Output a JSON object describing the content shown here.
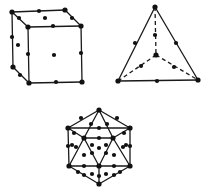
{
  "figure": {
    "colors": {
      "line": "#1a1a1a",
      "atom": "#111111",
      "background": "#ffffff"
    },
    "structures": [
      {
        "name": "face-centered-cube",
        "shape": "cube",
        "vertices": [
          [
            12,
            12
          ],
          [
            65,
            10
          ],
          [
            81,
            26
          ],
          [
            28,
            27
          ],
          [
            13,
            67
          ],
          [
            29,
            83
          ],
          [
            82,
            82
          ]
        ],
        "edges": [
          [
            0,
            1
          ],
          [
            1,
            2
          ],
          [
            2,
            3
          ],
          [
            3,
            0
          ],
          [
            3,
            5
          ],
          [
            5,
            6
          ],
          [
            6,
            2
          ],
          [
            0,
            4
          ],
          [
            4,
            5
          ]
        ],
        "atoms": [
          [
            12,
            12
          ],
          [
            39,
            11
          ],
          [
            65,
            10
          ],
          [
            19,
            18
          ],
          [
            72,
            18
          ],
          [
            28,
            27
          ],
          [
            53,
            26
          ],
          [
            81,
            26
          ],
          [
            45,
            18
          ],
          [
            12,
            37
          ],
          [
            18,
            45
          ],
          [
            28,
            54
          ],
          [
            81,
            53
          ],
          [
            54,
            55
          ],
          [
            13,
            67
          ],
          [
            20,
            75
          ],
          [
            29,
            83
          ],
          [
            56,
            82
          ],
          [
            82,
            82
          ]
        ]
      },
      {
        "name": "tetrahedron",
        "shape": "tetrahedron",
        "vertices": [
          [
            155,
            7
          ],
          [
            118,
            81
          ],
          [
            198,
            80
          ],
          [
            156,
            55
          ]
        ],
        "edges": [
          [
            0,
            1
          ],
          [
            0,
            2
          ],
          [
            1,
            2
          ]
        ],
        "dashed_edges": [
          [
            0,
            3
          ],
          [
            3,
            1
          ],
          [
            3,
            2
          ]
        ],
        "atoms": [
          [
            155,
            7
          ],
          [
            135,
            43
          ],
          [
            176,
            43
          ],
          [
            155,
            35
          ],
          [
            156,
            55
          ],
          [
            141,
            66
          ],
          [
            174,
            67
          ],
          [
            118,
            81
          ],
          [
            157,
            81
          ],
          [
            198,
            80
          ]
        ]
      },
      {
        "name": "icosahedron",
        "shape": "icosahedron",
        "vertices": [
          [
            99,
            110
          ],
          [
            68,
            128
          ],
          [
            130,
            128
          ],
          [
            84,
            138
          ],
          [
            113,
            138
          ],
          [
            69,
            166
          ],
          [
            130,
            166
          ],
          [
            99,
            166
          ],
          [
            99,
            184
          ]
        ],
        "edges": [
          [
            0,
            1
          ],
          [
            0,
            2
          ],
          [
            0,
            3
          ],
          [
            0,
            4
          ],
          [
            1,
            3
          ],
          [
            3,
            4
          ],
          [
            4,
            2
          ],
          [
            1,
            5
          ],
          [
            2,
            6
          ],
          [
            3,
            5
          ],
          [
            3,
            7
          ],
          [
            4,
            7
          ],
          [
            4,
            6
          ],
          [
            5,
            7
          ],
          [
            7,
            6
          ],
          [
            5,
            8
          ],
          [
            7,
            8
          ],
          [
            6,
            8
          ],
          [
            1,
            2
          ]
        ],
        "atoms": [
          [
            99,
            110
          ],
          [
            68,
            128
          ],
          [
            130,
            128
          ],
          [
            84,
            138
          ],
          [
            113,
            138
          ],
          [
            69,
            166
          ],
          [
            130,
            166
          ],
          [
            99,
            166
          ],
          [
            99,
            184
          ],
          [
            81,
            118
          ],
          [
            117,
            118
          ],
          [
            91,
            124
          ],
          [
            107,
            124
          ],
          [
            99,
            128
          ],
          [
            74,
            133
          ],
          [
            124,
            133
          ],
          [
            99,
            138
          ],
          [
            76,
            147
          ],
          [
            123,
            147
          ],
          [
            68,
            146
          ],
          [
            72,
            145
          ],
          [
            130,
            146
          ],
          [
            126,
            145
          ],
          [
            99,
            148
          ],
          [
            92,
            153
          ],
          [
            106,
            153
          ],
          [
            84,
            155
          ],
          [
            114,
            155
          ],
          [
            84,
            166
          ],
          [
            114,
            166
          ],
          [
            78,
            172
          ],
          [
            120,
            172
          ],
          [
            92,
            174
          ],
          [
            106,
            174
          ],
          [
            99,
            176
          ],
          [
            84,
            175
          ],
          [
            114,
            175
          ],
          [
            92,
            145
          ],
          [
            106,
            145
          ]
        ]
      }
    ]
  }
}
